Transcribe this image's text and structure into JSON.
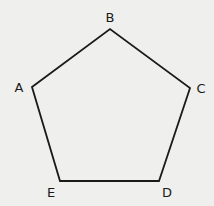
{
  "diagram": {
    "type": "regular-pentagon",
    "background": "#efefed",
    "stroke_color": "#1a1a1a",
    "vertices": [
      {
        "label": "A",
        "x": 32,
        "y": 87,
        "label_x": 19,
        "label_y": 87
      },
      {
        "label": "B",
        "x": 110,
        "y": 29,
        "label_x": 110,
        "label_y": 17
      },
      {
        "label": "C",
        "x": 190,
        "y": 88,
        "label_x": 201,
        "label_y": 88
      },
      {
        "label": "D",
        "x": 159,
        "y": 181,
        "label_x": 167,
        "label_y": 192
      },
      {
        "label": "E",
        "x": 60,
        "y": 181,
        "label_x": 51,
        "label_y": 192
      }
    ]
  }
}
